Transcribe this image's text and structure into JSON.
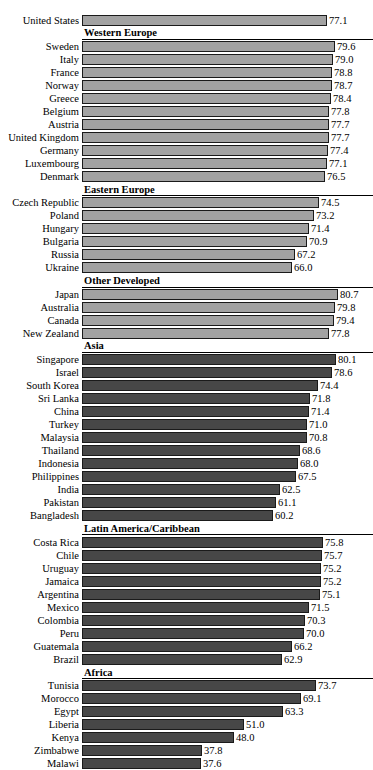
{
  "chart_data": {
    "type": "bar",
    "orientation": "horizontal",
    "title": "",
    "subtitle": "",
    "xlabel": "",
    "ylabel": "",
    "grid": false,
    "legend": null,
    "value_format": "one-decimal",
    "xlim": [
      0,
      82
    ],
    "colors": {
      "light_bar": "#a2a2a2",
      "dark_bar": "#474747",
      "bar_border": "#1a1a1a",
      "header_band": "#ffffff",
      "text": "#000000"
    },
    "groups": [
      {
        "header": null,
        "shade": "light",
        "categories": [
          "United States"
        ],
        "values": [
          77.1
        ]
      },
      {
        "header": "Western Europe",
        "shade": "light",
        "categories": [
          "Sweden",
          "Italy",
          "France",
          "Norway",
          "Greece",
          "Belgium",
          "Austria",
          "United Kingdom",
          "Germany",
          "Luxembourg",
          "Denmark"
        ],
        "values": [
          79.6,
          79.0,
          78.8,
          78.7,
          78.4,
          77.8,
          77.7,
          77.7,
          77.4,
          77.1,
          76.5
        ]
      },
      {
        "header": "Eastern Europe",
        "shade": "light",
        "categories": [
          "Czech Republic",
          "Poland",
          "Hungary",
          "Bulgaria",
          "Russia",
          "Ukraine"
        ],
        "values": [
          74.5,
          73.2,
          71.4,
          70.9,
          67.2,
          66.0
        ]
      },
      {
        "header": "Other Developed",
        "shade": "light",
        "categories": [
          "Japan",
          "Australia",
          "Canada",
          "New Zealand"
        ],
        "values": [
          80.7,
          79.8,
          79.4,
          77.8
        ]
      },
      {
        "header": "Asia",
        "shade": "dark",
        "categories": [
          "Singapore",
          "Israel",
          "South Korea",
          "Sri Lanka",
          "China",
          "Turkey",
          "Malaysia",
          "Thailand",
          "Indonesia",
          "Philippines",
          "India",
          "Pakistan",
          "Bangladesh"
        ],
        "values": [
          80.1,
          78.6,
          74.4,
          71.8,
          71.4,
          71.0,
          70.8,
          68.6,
          68.0,
          67.5,
          62.5,
          61.1,
          60.2
        ]
      },
      {
        "header": "Latin America/Caribbean",
        "shade": "dark",
        "categories": [
          "Costa Rica",
          "Chile",
          "Uruguay",
          "Jamaica",
          "Argentina",
          "Mexico",
          "Colombia",
          "Peru",
          "Guatemala",
          "Brazil"
        ],
        "values": [
          75.8,
          75.7,
          75.2,
          75.2,
          75.1,
          71.5,
          70.3,
          70.0,
          66.2,
          62.9
        ]
      },
      {
        "header": "Africa",
        "shade": "dark",
        "categories": [
          "Tunisia",
          "Morocco",
          "Egypt",
          "Liberia",
          "Kenya",
          "Zimbabwe",
          "Malawi"
        ],
        "values": [
          73.7,
          69.1,
          63.3,
          51.0,
          48.0,
          37.8,
          37.6
        ]
      }
    ]
  }
}
